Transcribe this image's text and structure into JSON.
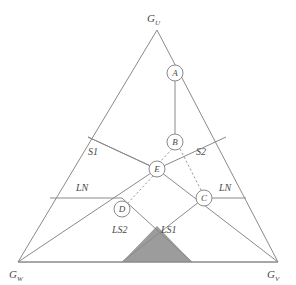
{
  "figure": {
    "type": "ternary-phase-diagram",
    "background_color": "#ffffff",
    "line_color": "#8a8a8a",
    "shade_color": "#9c9c9c",
    "text_color": "#4a4a4a"
  },
  "vertices": {
    "top": {
      "base": "G",
      "sub": "U",
      "x": 157,
      "y": 30,
      "label_x": 148,
      "label_y": 22
    },
    "bottom_left": {
      "base": "G",
      "sub": "W",
      "x": 18,
      "y": 262,
      "label_x": 10,
      "label_y": 278
    },
    "bottom_right": {
      "base": "G",
      "sub": "V",
      "x": 278,
      "y": 262,
      "label_x": 268,
      "label_y": 278
    }
  },
  "nodes": [
    {
      "id": "A",
      "label": "A",
      "x": 175,
      "y": 73,
      "r": 8
    },
    {
      "id": "B",
      "label": "B",
      "x": 175,
      "y": 142,
      "r": 8
    },
    {
      "id": "E",
      "label": "E",
      "x": 157,
      "y": 169,
      "r": 8
    },
    {
      "id": "C",
      "label": "C",
      "x": 204,
      "y": 198,
      "r": 8
    },
    {
      "id": "D",
      "label": "D",
      "x": 122,
      "y": 209,
      "r": 8
    }
  ],
  "region_labels": [
    {
      "text": "S1",
      "x": 88,
      "y": 155
    },
    {
      "text": "S2",
      "x": 196,
      "y": 155
    },
    {
      "text": "LN",
      "x": 76,
      "y": 191
    },
    {
      "text": "LN",
      "x": 219,
      "y": 191
    },
    {
      "text": "LS2",
      "x": 112,
      "y": 233
    },
    {
      "text": "LS1",
      "x": 161,
      "y": 233
    }
  ],
  "solid_segments": [
    {
      "name": "node-a-to-node-b",
      "x1": 175,
      "y1": 81,
      "x2": 175,
      "y2": 134
    },
    {
      "name": "s1-boundary-left",
      "x1": 88,
      "y1": 137,
      "x2": 157,
      "y2": 169
    },
    {
      "name": "s2-boundary-right",
      "x1": 226,
      "y1": 137,
      "x2": 157,
      "y2": 169
    },
    {
      "name": "ln-left-horizontal",
      "x1": 50,
      "y1": 198,
      "x2": 122,
      "y2": 198
    },
    {
      "name": "ln-right-horizontal",
      "x1": 204,
      "y1": 198,
      "x2": 246,
      "y2": 198
    },
    {
      "name": "eutectic-left-arm",
      "x1": 18,
      "y1": 262,
      "x2": 157,
      "y2": 169
    },
    {
      "name": "eutectic-right-arm",
      "x1": 278,
      "y1": 262,
      "x2": 157,
      "y2": 169
    },
    {
      "name": "ls2-boundary",
      "x1": 122,
      "y1": 198,
      "x2": 192,
      "y2": 262
    },
    {
      "name": "ls1-boundary",
      "x1": 204,
      "y1": 198,
      "x2": 122,
      "y2": 262
    }
  ],
  "dashed_segments": [
    {
      "name": "node-b-to-node-e",
      "x1": 172,
      "y1": 149,
      "x2": 160,
      "y2": 162
    },
    {
      "name": "node-b-to-node-c",
      "x1": 180,
      "y1": 149,
      "x2": 201,
      "y2": 190
    },
    {
      "name": "node-e-to-node-d",
      "x1": 153,
      "y1": 176,
      "x2": 127,
      "y2": 204
    }
  ],
  "shaded_region": {
    "name": "two-phase-field",
    "points": "122,262 157,226 192,262"
  },
  "triangle_outline": {
    "points": "157,30 278,262 18,262"
  },
  "bottom_axis": {
    "x1": 18,
    "y1": 262,
    "x2": 278,
    "y2": 262
  }
}
